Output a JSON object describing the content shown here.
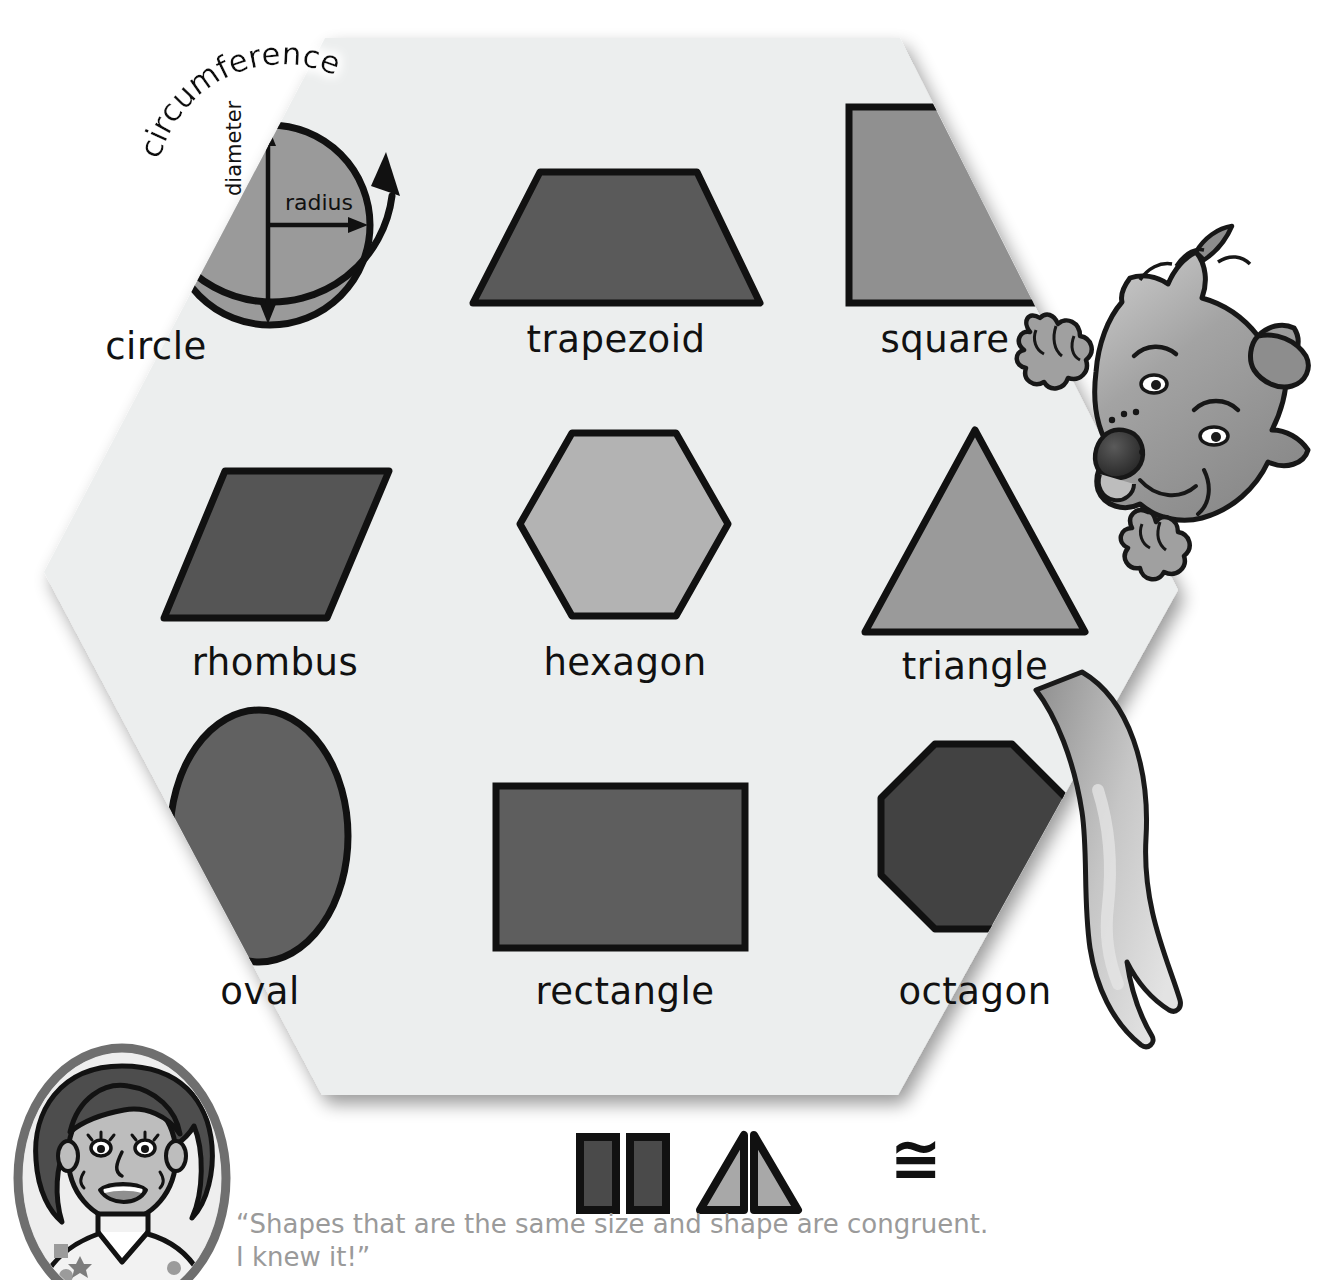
{
  "poster": {
    "title_shapes": "Shapes",
    "background_color": "#eceeee",
    "shadow_color": "#c9c9c9"
  },
  "circle_diagram": {
    "name": "circle",
    "circumference_label": "circumference",
    "radius_label": "radius",
    "diameter_label": "diameter",
    "fill_color": "#9a9a9a"
  },
  "shapes": [
    {
      "id": "trapezoid",
      "label": "trapezoid",
      "fill": "#5a5a5a",
      "stroke": "#111111"
    },
    {
      "id": "square",
      "label": "square",
      "fill": "#909090",
      "stroke": "#111111"
    },
    {
      "id": "rhombus",
      "label": "rhombus",
      "fill": "#555555",
      "stroke": "#111111"
    },
    {
      "id": "hexagon",
      "label": "hexagon",
      "fill": "#b3b3b3",
      "stroke": "#111111"
    },
    {
      "id": "triangle",
      "label": "triangle",
      "fill": "#9a9a9a",
      "stroke": "#111111"
    },
    {
      "id": "oval",
      "label": "oval",
      "fill": "#616161",
      "stroke": "#111111"
    },
    {
      "id": "rectangle",
      "label": "rectangle",
      "fill": "#5e5e5e",
      "stroke": "#111111"
    },
    {
      "id": "octagon",
      "label": "octagon",
      "fill": "#424242",
      "stroke": "#111111"
    }
  ],
  "congruent_examples": {
    "bars_fill": "#4a4a4a",
    "triangles_fill": "#a8a8a8",
    "symbol": "≅",
    "symbol_name": "congruent-symbol"
  },
  "caption": {
    "line1": "“Shapes that are the same size and shape are congruent.",
    "line2": "I knew it!”",
    "color": "#9a9a9a"
  },
  "characters": {
    "wolf": "wolf-mascot",
    "teacher": "teacher-portrait"
  }
}
